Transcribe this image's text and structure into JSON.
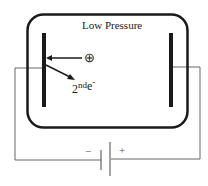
{
  "diagram": {
    "chamber_label": "Low Pressure",
    "positive_ion_symbol": "⊕",
    "secondary_electron": {
      "base": "2",
      "sup": "nd",
      "symbol": "e",
      "charge": "-"
    },
    "battery": {
      "negative_label": "−",
      "positive_label": "+"
    },
    "colors": {
      "stroke": "#1a1a1a",
      "wire": "#555555"
    }
  }
}
